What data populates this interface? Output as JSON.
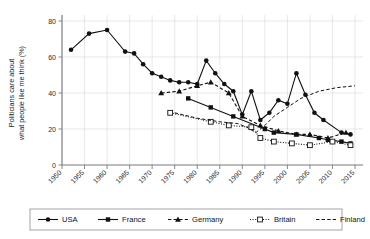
{
  "chart_data": {
    "type": "line",
    "title": "",
    "xlabel": "",
    "ylabel": "Politicians care about what people like me think (%)",
    "xlim": [
      1950,
      2015
    ],
    "ylim": [
      0,
      80
    ],
    "xticks": [
      1950,
      1955,
      1960,
      1965,
      1970,
      1975,
      1980,
      1985,
      1990,
      1995,
      2000,
      2005,
      2010,
      2015
    ],
    "yticks": [
      0,
      20,
      40,
      60,
      80
    ],
    "grid": true,
    "legend_position": "bottom",
    "series": [
      {
        "name": "USA",
        "marker": "filled-circle",
        "linestyle": "solid",
        "color": "#111111",
        "points": [
          [
            1952,
            64
          ],
          [
            1956,
            73
          ],
          [
            1960,
            75
          ],
          [
            1964,
            63
          ],
          [
            1966,
            62
          ],
          [
            1968,
            56
          ],
          [
            1970,
            51
          ],
          [
            1972,
            49
          ],
          [
            1974,
            47
          ],
          [
            1976,
            46
          ],
          [
            1978,
            46
          ],
          [
            1980,
            45
          ],
          [
            1982,
            58
          ],
          [
            1984,
            51
          ],
          [
            1986,
            45
          ],
          [
            1988,
            41
          ],
          [
            1990,
            28
          ],
          [
            1992,
            41
          ],
          [
            1994,
            25
          ],
          [
            1996,
            29
          ],
          [
            1998,
            36
          ],
          [
            2000,
            34
          ],
          [
            2002,
            51
          ],
          [
            2004,
            39
          ],
          [
            2006,
            29
          ],
          [
            2008,
            25
          ],
          [
            2012,
            18
          ],
          [
            2014,
            17
          ]
        ]
      },
      {
        "name": "France",
        "marker": "filled-square",
        "linestyle": "solid",
        "color": "#111111",
        "points": [
          [
            1978,
            37
          ],
          [
            1983,
            32
          ],
          [
            1988,
            27
          ],
          [
            1995,
            20
          ],
          [
            1997,
            18
          ],
          [
            2002,
            17
          ],
          [
            2007,
            15
          ],
          [
            2009,
            14
          ],
          [
            2012,
            13
          ],
          [
            2014,
            12
          ]
        ]
      },
      {
        "name": "Germany",
        "marker": "filled-triangle",
        "linestyle": "dashed",
        "color": "#111111",
        "points": [
          [
            1972,
            40
          ],
          [
            1976,
            41
          ],
          [
            1980,
            44
          ],
          [
            1983,
            46
          ],
          [
            1987,
            40
          ],
          [
            1990,
            27
          ],
          [
            1994,
            22
          ],
          [
            1998,
            19
          ],
          [
            2002,
            17
          ],
          [
            2005,
            17
          ],
          [
            2009,
            15
          ],
          [
            2013,
            18
          ]
        ]
      },
      {
        "name": "Britain",
        "marker": "open-square",
        "linestyle": "dotted",
        "color": "#111111",
        "points": [
          [
            1974,
            29
          ],
          [
            1983,
            24
          ],
          [
            1987,
            22
          ],
          [
            1992,
            21
          ],
          [
            1994,
            15
          ],
          [
            1997,
            13
          ],
          [
            2001,
            12
          ],
          [
            2005,
            11
          ],
          [
            2010,
            13
          ],
          [
            2014,
            11
          ]
        ]
      },
      {
        "name": "Finland",
        "marker": "none",
        "linestyle": "dashed",
        "color": "#555555",
        "points": [
          [
            1975,
            29
          ],
          [
            1980,
            26
          ],
          [
            1985,
            24
          ],
          [
            1989,
            23
          ],
          [
            1991,
            21
          ],
          [
            1993,
            18
          ],
          [
            1995,
            22
          ],
          [
            1997,
            27
          ],
          [
            2000,
            32
          ],
          [
            2003,
            37
          ],
          [
            2007,
            41
          ],
          [
            2011,
            43
          ],
          [
            2015,
            44
          ]
        ]
      }
    ],
    "legend": [
      {
        "label": "USA",
        "marker": "filled-circle",
        "linestyle": "solid"
      },
      {
        "label": "France",
        "marker": "filled-square",
        "linestyle": "solid"
      },
      {
        "label": "Germany",
        "marker": "filled-triangle",
        "linestyle": "dashed"
      },
      {
        "label": "Britain",
        "marker": "open-square",
        "linestyle": "dotted"
      },
      {
        "label": "Finland",
        "marker": "none",
        "linestyle": "dashed"
      }
    ]
  }
}
